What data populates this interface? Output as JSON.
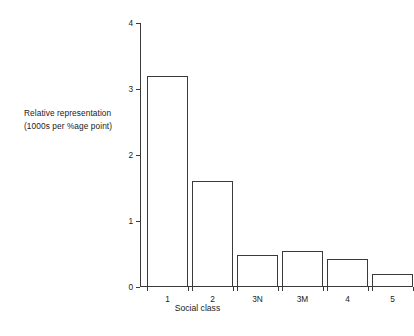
{
  "chart_data": {
    "type": "bar",
    "title": "",
    "subtitle": "",
    "xlabel": "Social class",
    "ylabel": "Relative representation (1000s per %age point)",
    "ylabel_lines": [
      "Relative representation",
      "(1000s per %age point)"
    ],
    "categories": [
      "1",
      "2",
      "3N",
      "3M",
      "4",
      "5"
    ],
    "values": [
      3.2,
      1.6,
      0.48,
      0.55,
      0.43,
      0.2
    ],
    "series": [
      {
        "name": "Relative representation",
        "values": [
          3.2,
          1.6,
          0.48,
          0.55,
          0.43,
          0.2
        ]
      }
    ],
    "ylim": [
      0,
      4
    ],
    "xlim": [
      0,
      6
    ],
    "y_ticks": [
      "0",
      "1",
      "2",
      "3",
      "4"
    ],
    "y_tick_values": [
      0,
      1,
      2,
      3,
      4
    ],
    "grid": false,
    "legend": false,
    "legend_position": "none",
    "bar_fill": "#ffffff",
    "bar_edge_color": "#3a3a3a",
    "axis_color": "#3a3a3a",
    "background": "#ffffff",
    "text_color": "#1a1a1a"
  }
}
